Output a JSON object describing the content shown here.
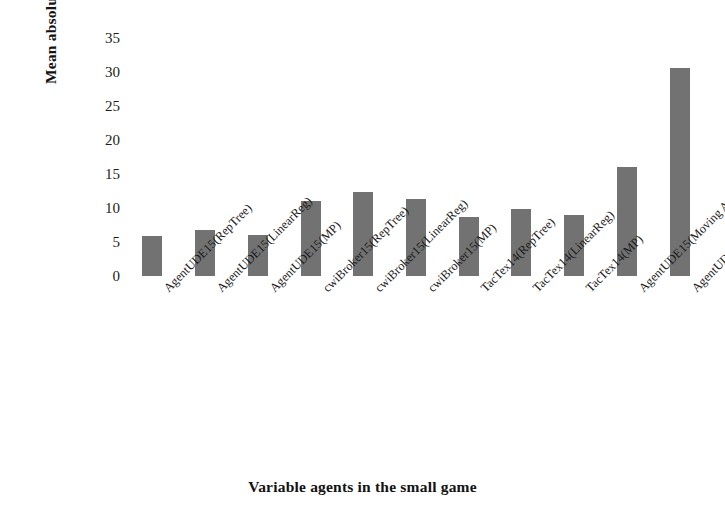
{
  "chart_data": {
    "type": "bar",
    "title": "",
    "xlabel": "Variable agents in the small game",
    "ylabel": "Mean absolute error",
    "ylim": [
      0,
      35
    ],
    "ytick_step": 5,
    "yticks": [
      "35",
      "30",
      "25",
      "20",
      "15",
      "10",
      "5",
      "0"
    ],
    "grid": false,
    "legend": "none",
    "bar_color": "#727272",
    "categories": [
      "AgentUDE15(RepTree)",
      "AgentUDE15(LinearReg)",
      "AgentUDE15(MP)",
      "cwiBroker15(RepTree)",
      "cwiBroker15(LinearReg)",
      "cwiBroker15(MP)",
      "TacTex14(RepTree)",
      "TacTex14(LinearReg)",
      "TacTex14(MP)",
      "AgentUDE15(Moving Avg)",
      "AgentUDE15(RepTree-without Est)"
    ],
    "values": [
      5.9,
      6.7,
      6.1,
      11.0,
      12.3,
      11.3,
      8.7,
      9.9,
      9.0,
      16.0,
      30.6
    ]
  }
}
